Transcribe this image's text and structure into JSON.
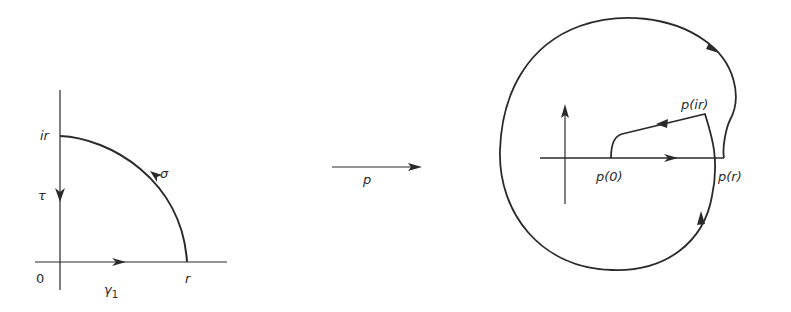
{
  "figure": {
    "left": {
      "labels": {
        "origin": "0",
        "ir": "ir",
        "r": "r",
        "tau": "τ",
        "sigma": "σ",
        "gamma1": "γ",
        "gamma1_sub": "1"
      }
    },
    "mapping": {
      "label": "p"
    },
    "right": {
      "labels": {
        "p0": "p(0)",
        "pr": "p(r)",
        "pir": "p(ir)"
      }
    },
    "colors": {
      "ink": "#2a2a2a",
      "background": "#ffffff"
    }
  }
}
